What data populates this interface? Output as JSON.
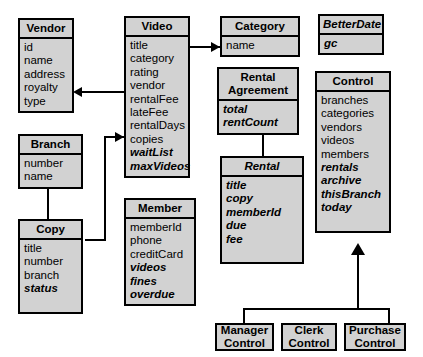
{
  "diagram": {
    "fill_color": "#d2d2d2",
    "line_color": "#000000",
    "background_color": "#ffffff"
  },
  "classes": [
    {
      "id": "vendor",
      "name": "Vendor",
      "abstract": false,
      "attributes": [
        {
          "text": "id",
          "style": "plain"
        },
        {
          "text": "name",
          "style": "plain"
        },
        {
          "text": "address",
          "style": "plain"
        },
        {
          "text": "royalty",
          "style": "plain"
        },
        {
          "text": "type",
          "style": "plain"
        }
      ]
    },
    {
      "id": "branch",
      "name": "Branch",
      "abstract": false,
      "attributes": [
        {
          "text": "number",
          "style": "plain"
        },
        {
          "text": "name",
          "style": "plain"
        }
      ]
    },
    {
      "id": "copy",
      "name": "Copy",
      "abstract": false,
      "attributes": [
        {
          "text": "title",
          "style": "plain"
        },
        {
          "text": "number",
          "style": "plain"
        },
        {
          "text": "branch",
          "style": "plain"
        },
        {
          "text": "status",
          "style": "bold-italic"
        }
      ]
    },
    {
      "id": "video",
      "name": "Video",
      "abstract": false,
      "attributes": [
        {
          "text": "title",
          "style": "plain"
        },
        {
          "text": "category",
          "style": "plain"
        },
        {
          "text": "rating",
          "style": "plain"
        },
        {
          "text": "vendor",
          "style": "plain"
        },
        {
          "text": "rentalFee",
          "style": "plain"
        },
        {
          "text": "lateFee",
          "style": "plain"
        },
        {
          "text": "rentalDays",
          "style": "plain"
        },
        {
          "text": "copies",
          "style": "plain"
        },
        {
          "text": "waitList",
          "style": "bold-italic"
        },
        {
          "text": "maxVideos",
          "style": "bold-italic"
        }
      ]
    },
    {
      "id": "member",
      "name": "Member",
      "abstract": false,
      "attributes": [
        {
          "text": "memberId",
          "style": "plain"
        },
        {
          "text": "phone",
          "style": "plain"
        },
        {
          "text": "creditCard",
          "style": "plain"
        },
        {
          "text": "videos",
          "style": "bold-italic"
        },
        {
          "text": "fines",
          "style": "bold-italic"
        },
        {
          "text": "overdue",
          "style": "bold-italic"
        }
      ]
    },
    {
      "id": "category",
      "name": "Category",
      "abstract": false,
      "attributes": [
        {
          "text": "name",
          "style": "plain"
        }
      ]
    },
    {
      "id": "rental-agreement",
      "name": "Rental Agreement",
      "abstract": false,
      "attributes": [
        {
          "text": "total",
          "style": "bold-italic"
        },
        {
          "text": "rentCount",
          "style": "bold-italic"
        }
      ]
    },
    {
      "id": "rental",
      "name": "Rental",
      "abstract": true,
      "attributes": [
        {
          "text": "title",
          "style": "bold-italic"
        },
        {
          "text": "copy",
          "style": "bold-italic"
        },
        {
          "text": "memberId",
          "style": "bold-italic"
        },
        {
          "text": "due",
          "style": "bold-italic"
        },
        {
          "text": "fee",
          "style": "bold-italic"
        }
      ]
    },
    {
      "id": "betterdate",
      "name": "BetterDate",
      "abstract": true,
      "attributes": [
        {
          "text": "gc",
          "style": "bold-italic"
        }
      ]
    },
    {
      "id": "control",
      "name": "Control",
      "abstract": false,
      "attributes": [
        {
          "text": "branches",
          "style": "plain"
        },
        {
          "text": "categories",
          "style": "plain"
        },
        {
          "text": "vendors",
          "style": "plain"
        },
        {
          "text": "videos",
          "style": "plain"
        },
        {
          "text": "members",
          "style": "plain"
        },
        {
          "text": "rentals",
          "style": "bold-italic"
        },
        {
          "text": "archive",
          "style": "bold-italic"
        },
        {
          "text": "thisBranch",
          "style": "bold-italic"
        },
        {
          "text": "today",
          "style": "bold-italic"
        }
      ]
    },
    {
      "id": "manager-control",
      "name": "Manager Control",
      "abstract": false,
      "attributes": []
    },
    {
      "id": "clerk-control",
      "name": "Clerk Control",
      "abstract": false,
      "attributes": []
    },
    {
      "id": "purchase-control",
      "name": "Purchase Control",
      "abstract": false,
      "attributes": []
    }
  ],
  "relationships": [
    {
      "from": "video",
      "to": "vendor",
      "kind": "association-arrow"
    },
    {
      "from": "video",
      "to": "category",
      "kind": "association-arrow"
    },
    {
      "from": "copy",
      "to": "video",
      "kind": "association-arrow"
    },
    {
      "from": "copy",
      "to": "branch",
      "kind": "generalization"
    },
    {
      "from": "rental-agreement",
      "to": "rental",
      "kind": "association"
    },
    {
      "from": "manager-control",
      "to": "control",
      "kind": "generalization"
    },
    {
      "from": "clerk-control",
      "to": "control",
      "kind": "generalization"
    },
    {
      "from": "purchase-control",
      "to": "control",
      "kind": "generalization"
    }
  ]
}
